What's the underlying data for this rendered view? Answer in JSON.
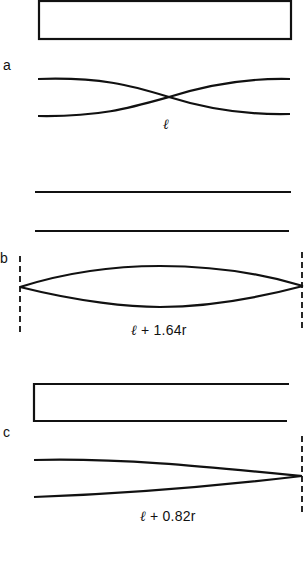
{
  "figure": {
    "panels": [
      {
        "label": "a",
        "length_label": "ℓ",
        "length_suffix": ""
      },
      {
        "label": "b",
        "length_label": "ℓ",
        "length_suffix": " + 1.64r"
      },
      {
        "label": "c",
        "length_label": "ℓ",
        "length_suffix": " + 0.82r"
      }
    ]
  }
}
